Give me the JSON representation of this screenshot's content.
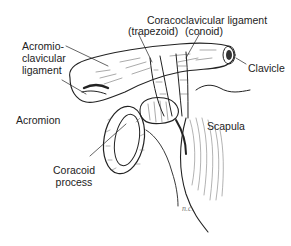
{
  "figure": {
    "labels": {
      "coracoclavicular_line1": "Coracoclavicular ligament",
      "trapezoid": "(trapezoid)",
      "conoid": "(conoid)",
      "acromioclavicular": "Acromio-\nclavicular\nligament",
      "clavicle": "Clavicle",
      "acromion": "Acromion",
      "scapula": "Scapula",
      "coracoid": "Coracoid\nprocess"
    },
    "signature": "n.c.",
    "colors": {
      "ink": "#222222",
      "background": "#ffffff"
    }
  }
}
